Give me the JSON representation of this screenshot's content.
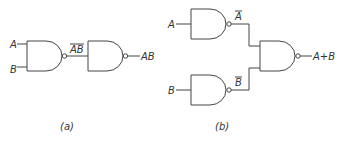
{
  "figure": {
    "panel_a": {
      "caption": "(a)",
      "inputs": [
        "A",
        "B"
      ],
      "intermediate_label": "AB",
      "intermediate_overline": true,
      "output_label": "AB",
      "gates": [
        "NAND",
        "NAND"
      ]
    },
    "panel_b": {
      "caption": "(b)",
      "inputs": [
        "A",
        "B"
      ],
      "top_output_label": "A",
      "top_overline": true,
      "bottom_output_label": "B",
      "bottom_overline": true,
      "output_label": "A+B",
      "gates": [
        "NAND",
        "NAND",
        "NAND"
      ]
    }
  },
  "colors": {
    "line": "#444444",
    "text": "#333333",
    "background": "#ffffff"
  }
}
